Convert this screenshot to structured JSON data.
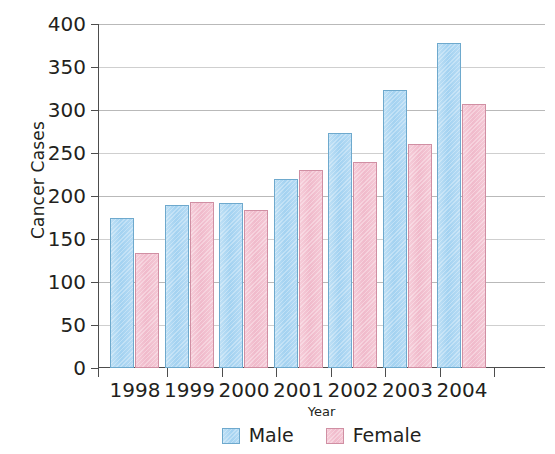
{
  "chart_data": {
    "type": "bar",
    "title": "",
    "xlabel": "Year",
    "ylabel": "Cancer Cases",
    "categories": [
      "1998",
      "1999",
      "2000",
      "2001",
      "2002",
      "2003",
      "2004"
    ],
    "series": [
      {
        "name": "Male",
        "color": "#a3d2f1",
        "values": [
          175,
          190,
          192,
          220,
          273,
          323,
          378
        ]
      },
      {
        "name": "Female",
        "color": "#f0bacb",
        "values": [
          134,
          193,
          184,
          230,
          240,
          260,
          307
        ]
      }
    ],
    "ylim": [
      0,
      400
    ],
    "yticks": [
      0,
      50,
      100,
      150,
      200,
      250,
      300,
      350,
      400
    ],
    "ytick_labels": [
      "0",
      "50",
      "100",
      "150",
      "200",
      "250",
      "300",
      "350",
      "400"
    ],
    "grid": true,
    "legend_position": "bottom"
  },
  "axes": {
    "y_title": "Cancer Cases",
    "x_title": "Year"
  },
  "legend": {
    "items": [
      {
        "label": "Male",
        "swatch": "male-swatch"
      },
      {
        "label": "Female",
        "swatch": "female-swatch"
      }
    ]
  }
}
